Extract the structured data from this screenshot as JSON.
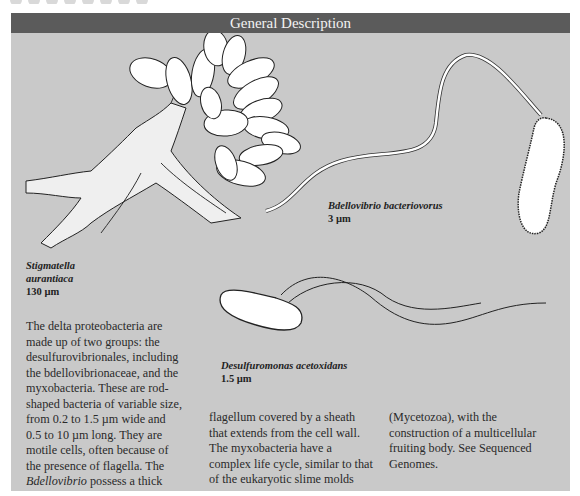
{
  "header": {
    "title": "General Description"
  },
  "colors": {
    "header_bg": "#5b5b5b",
    "panel_bg": "#c9c9c9",
    "header_text": "#f2f2f2",
    "body_text": "#2a2a2a"
  },
  "figures": [
    {
      "species_line1": "Stigmatella",
      "species_line2": "aurantiaca",
      "size": "130 µm"
    },
    {
      "species": "Bdellovibrio bacteriovorus",
      "size": "3 µm"
    },
    {
      "species": "Desulfuromonas acetoxidans",
      "size": "1.5 µm"
    }
  ],
  "body": {
    "col1": {
      "lines": [
        "The delta proteobacteria are",
        "made up of two groups: the",
        "desulfurovibrionales, including",
        "the bdellovibrionaceae, and the",
        "myxobacteria. These are rod-",
        "shaped bacteria of variable size,",
        "from 0.2 to 1.5 µm wide and",
        "0.5 to 10 µm long. They are",
        "motile cells, often because of",
        "the presence of flagella. The"
      ],
      "last_italic": "Bdellovibrio",
      "last_rest": " possess a thick"
    },
    "col2": {
      "lines": [
        "flagellum covered by a sheath",
        "that extends from the cell wall.",
        "The myxobacteria have a",
        "complex life cycle, similar to that",
        "of the eukaryotic slime molds"
      ]
    },
    "col3": {
      "lines": [
        "(Mycetozoa), with the",
        "construction of a multicellular",
        "fruiting body. See Sequenced",
        "Genomes."
      ]
    }
  }
}
